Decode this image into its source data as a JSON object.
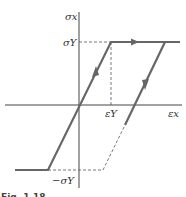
{
  "diagram": {
    "type": "stress-strain elastic-perfectly-plastic hysteresis",
    "labels": {
      "y_axis": "σx",
      "x_axis": "εx",
      "yield_stress": "σY",
      "neg_yield_stress": "−σY",
      "yield_strain": "εY"
    },
    "caption": "Fig. 1.18",
    "colors": {
      "path": "#666666",
      "axes": "#444444",
      "dashed": "#555555"
    }
  }
}
